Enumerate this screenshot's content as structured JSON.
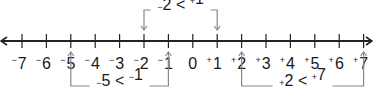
{
  "number_line": {
    "min": -7,
    "max": 7,
    "ticks": [
      {
        "value": -7,
        "sign": "−",
        "digit": "7"
      },
      {
        "value": -6,
        "sign": "−",
        "digit": "6"
      },
      {
        "value": -5,
        "sign": "−",
        "digit": "5"
      },
      {
        "value": -4,
        "sign": "−",
        "digit": "4"
      },
      {
        "value": -3,
        "sign": "−",
        "digit": "3"
      },
      {
        "value": -2,
        "sign": "−",
        "digit": "2"
      },
      {
        "value": -1,
        "sign": "−",
        "digit": "1"
      },
      {
        "value": 0,
        "sign": "",
        "digit": "0"
      },
      {
        "value": 1,
        "sign": "+",
        "digit": "1"
      },
      {
        "value": 2,
        "sign": "+",
        "digit": "2"
      },
      {
        "value": 3,
        "sign": "+",
        "digit": "3"
      },
      {
        "value": 4,
        "sign": "+",
        "digit": "4"
      },
      {
        "value": 5,
        "sign": "+",
        "digit": "5"
      },
      {
        "value": 6,
        "sign": "+",
        "digit": "6"
      },
      {
        "value": 7,
        "sign": "+",
        "digit": "7"
      }
    ],
    "arrows_both_ends": true,
    "line_color": "#222222",
    "bracket_color": "#888888"
  },
  "comparisons": [
    {
      "position": "above",
      "left": {
        "sign": "−",
        "digit": "2"
      },
      "op": "<",
      "right": {
        "sign": "+",
        "digit": "1"
      },
      "from": -2,
      "to": 1
    },
    {
      "position": "below",
      "left": {
        "sign": "−",
        "digit": "5"
      },
      "op": "<",
      "right": {
        "sign": "−",
        "digit": "1"
      },
      "from": -5,
      "to": -1
    },
    {
      "position": "below",
      "left": {
        "sign": "+",
        "digit": "2"
      },
      "op": "<",
      "right": {
        "sign": "+",
        "digit": "7"
      },
      "from": 2,
      "to": 7
    }
  ]
}
